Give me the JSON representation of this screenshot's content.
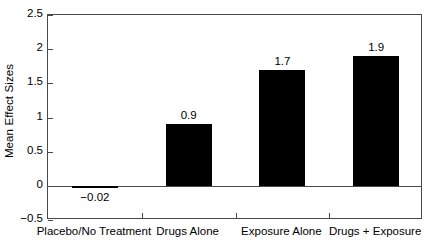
{
  "chart_data": {
    "type": "bar",
    "title": "",
    "xlabel": "",
    "ylabel": "Mean Effect Sizes",
    "categories": [
      "Placebo/No Treatment",
      "Drugs Alone",
      "Exposure Alone",
      "Drugs + Exposure"
    ],
    "values": [
      -0.02,
      0.9,
      1.7,
      1.9
    ],
    "value_labels": [
      "−0.02",
      "0.9",
      "1.7",
      "1.9"
    ],
    "ylim": [
      -0.5,
      2.5
    ],
    "ytick_labels": [
      "2.5",
      "2",
      "1.5",
      "1",
      "0.5",
      "0",
      "−0.5"
    ],
    "ytick_values": [
      2.5,
      2,
      1.5,
      1,
      0.5,
      0,
      -0.5
    ],
    "grid": false,
    "legend": "none",
    "bar_color": "#000000",
    "axis_color": "#4a4a4a",
    "background_color": "#ffffff"
  }
}
